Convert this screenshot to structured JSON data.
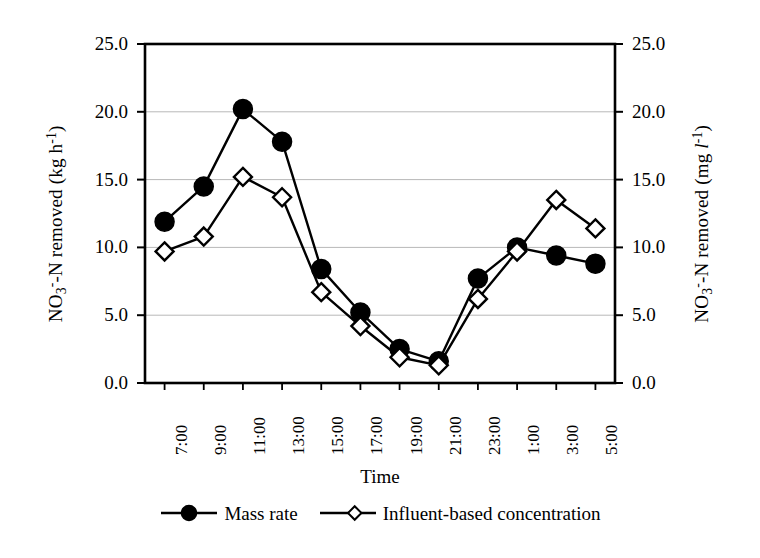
{
  "chart_data": {
    "type": "line",
    "title": "",
    "xlabel": "Time",
    "ylabel": "NO3--N removed (kg h-1)",
    "ylabel_right": "NO3--N removed (mg l-1)",
    "categories": [
      "7:00",
      "9:00",
      "11:00",
      "13:00",
      "15:00",
      "17:00",
      "19:00",
      "21:00",
      "23:00",
      "1:00",
      "3:00",
      "5:00"
    ],
    "ylim": [
      0,
      25
    ],
    "yticks": [
      "0.0",
      "5.0",
      "10.0",
      "15.0",
      "20.0",
      "25.0"
    ],
    "ytick_values": [
      0,
      5,
      10,
      15,
      20,
      25
    ],
    "yticks_right": [
      "0.0",
      "5.0",
      "10.0",
      "15.0",
      "20.0",
      "25.0"
    ],
    "grid": "horizontal",
    "legend_position": "bottom",
    "series": [
      {
        "name": "Mass rate",
        "marker": "filled-circle",
        "color": "#000000",
        "axis": "left",
        "values": [
          11.9,
          14.5,
          20.2,
          17.8,
          8.4,
          5.2,
          2.5,
          1.6,
          7.7,
          10.0,
          9.4,
          8.8
        ]
      },
      {
        "name": "Influent-based concentration",
        "marker": "open-diamond",
        "color": "#000000",
        "axis": "right",
        "values": [
          9.7,
          10.8,
          15.2,
          13.7,
          6.7,
          4.2,
          1.9,
          1.3,
          6.2,
          9.7,
          13.5,
          11.4
        ]
      }
    ]
  },
  "axes": {
    "left_title_parts": {
      "a": "NO",
      "sub": "3",
      "sup": "-",
      "b": "-N removed (kg h",
      "unit_sup": "-1",
      "c": ")"
    },
    "right_title_parts": {
      "a": "NO",
      "sub": "3",
      "sup": "-",
      "b": "-N removed (mg ",
      "ital": "l",
      "unit_sup": "-1",
      "c": ")"
    }
  },
  "legend": {
    "items": [
      {
        "label": "Mass rate",
        "marker": "filled-circle"
      },
      {
        "label": "Influent-based concentration",
        "marker": "open-diamond"
      }
    ]
  }
}
